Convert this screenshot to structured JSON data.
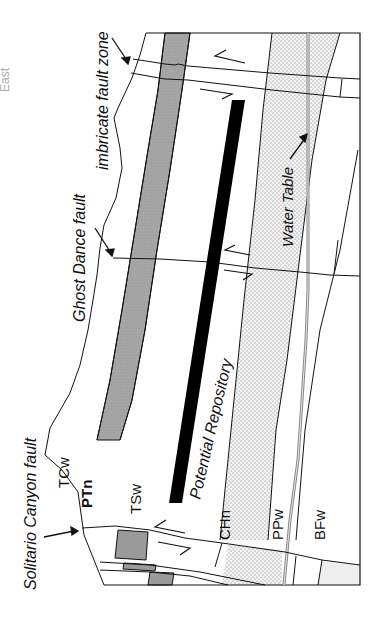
{
  "diagram": {
    "orientation_note": "rotated 90deg counter-clockwise",
    "corner_label": "East",
    "faults": {
      "solitario": "Solitario Canyon fault",
      "ghost_dance": "Ghost Dance fault",
      "imbricate": "imbricate fault zone"
    },
    "units": {
      "tcw": "TCw",
      "ptn": "PTn",
      "tsw": "TSw",
      "chn": "CHn",
      "ppw": "PPw",
      "bfw": "BFw"
    },
    "features": {
      "repository": "Potential Repository",
      "water_table": "Water Table"
    },
    "colors": {
      "ptn_fill": "#a9a9a9",
      "repository": "#000000",
      "line": "#111111",
      "stipple_bg": "#f2f2f2",
      "stipple_dot": "#777777"
    }
  }
}
